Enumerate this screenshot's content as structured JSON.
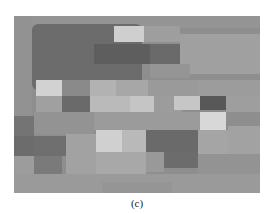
{
  "figure": {
    "caption": "(c)",
    "background": "#8f8f8f",
    "blocks": [
      {
        "x": 0,
        "y": 0,
        "w": 246,
        "h": 177,
        "c": "#8e8e8e"
      },
      {
        "x": 0,
        "y": 0,
        "w": 246,
        "h": 12,
        "c": "#949494"
      },
      {
        "x": 18,
        "y": 8,
        "w": 110,
        "h": 66,
        "c": "#6c6c6c",
        "r": 6
      },
      {
        "x": 100,
        "y": 10,
        "w": 30,
        "h": 16,
        "c": "#cfcfcf"
      },
      {
        "x": 130,
        "y": 10,
        "w": 36,
        "h": 16,
        "c": "#9e9e9e"
      },
      {
        "x": 80,
        "y": 28,
        "w": 56,
        "h": 20,
        "c": "#5e5e5e"
      },
      {
        "x": 136,
        "y": 28,
        "w": 30,
        "h": 20,
        "c": "#6a6a6a"
      },
      {
        "x": 166,
        "y": 18,
        "w": 80,
        "h": 40,
        "c": "#a0a0a0"
      },
      {
        "x": 0,
        "y": 0,
        "w": 18,
        "h": 100,
        "c": "#929292"
      },
      {
        "x": 136,
        "y": 48,
        "w": 40,
        "h": 14,
        "c": "#959595"
      },
      {
        "x": 22,
        "y": 64,
        "w": 26,
        "h": 16,
        "c": "#d2d2d2"
      },
      {
        "x": 48,
        "y": 64,
        "w": 28,
        "h": 16,
        "c": "#8a8a8a"
      },
      {
        "x": 76,
        "y": 64,
        "w": 26,
        "h": 16,
        "c": "#b2b2b2"
      },
      {
        "x": 102,
        "y": 64,
        "w": 32,
        "h": 16,
        "c": "#a7a7a7"
      },
      {
        "x": 134,
        "y": 64,
        "w": 50,
        "h": 16,
        "c": "#9a9a9a"
      },
      {
        "x": 184,
        "y": 64,
        "w": 62,
        "h": 16,
        "c": "#9c9c9c"
      },
      {
        "x": 22,
        "y": 80,
        "w": 26,
        "h": 16,
        "c": "#a0a0a0"
      },
      {
        "x": 48,
        "y": 80,
        "w": 28,
        "h": 16,
        "c": "#6a6a6a"
      },
      {
        "x": 76,
        "y": 80,
        "w": 40,
        "h": 16,
        "c": "#bababa"
      },
      {
        "x": 116,
        "y": 80,
        "w": 24,
        "h": 16,
        "c": "#c5c5c5"
      },
      {
        "x": 140,
        "y": 80,
        "w": 28,
        "h": 16,
        "c": "#9c9c9c"
      },
      {
        "x": 160,
        "y": 80,
        "w": 26,
        "h": 14,
        "c": "#c6c6c6"
      },
      {
        "x": 186,
        "y": 80,
        "w": 26,
        "h": 14,
        "c": "#585858"
      },
      {
        "x": 212,
        "y": 80,
        "w": 34,
        "h": 16,
        "c": "#9e9e9e"
      },
      {
        "x": 186,
        "y": 96,
        "w": 26,
        "h": 18,
        "c": "#d8d8d8"
      },
      {
        "x": 0,
        "y": 100,
        "w": 20,
        "h": 20,
        "c": "#747474"
      },
      {
        "x": 20,
        "y": 96,
        "w": 60,
        "h": 22,
        "c": "#939393"
      },
      {
        "x": 80,
        "y": 96,
        "w": 106,
        "h": 18,
        "c": "#9b9b9b"
      },
      {
        "x": 0,
        "y": 120,
        "w": 20,
        "h": 20,
        "c": "#6c6c6c"
      },
      {
        "x": 20,
        "y": 120,
        "w": 32,
        "h": 20,
        "c": "#6f6f6f"
      },
      {
        "x": 52,
        "y": 118,
        "w": 30,
        "h": 40,
        "c": "#a2a2a2"
      },
      {
        "x": 82,
        "y": 114,
        "w": 26,
        "h": 22,
        "c": "#d0d0d0"
      },
      {
        "x": 108,
        "y": 114,
        "w": 24,
        "h": 22,
        "c": "#b9b9b9"
      },
      {
        "x": 132,
        "y": 114,
        "w": 52,
        "h": 22,
        "c": "#6a6a6a"
      },
      {
        "x": 150,
        "y": 136,
        "w": 34,
        "h": 16,
        "c": "#6c6c6c"
      },
      {
        "x": 184,
        "y": 114,
        "w": 30,
        "h": 24,
        "c": "#a5a5a5"
      },
      {
        "x": 214,
        "y": 110,
        "w": 32,
        "h": 30,
        "c": "#a2a2a2"
      },
      {
        "x": 0,
        "y": 140,
        "w": 20,
        "h": 20,
        "c": "#9c9c9c"
      },
      {
        "x": 20,
        "y": 140,
        "w": 28,
        "h": 20,
        "c": "#7a7a7a"
      },
      {
        "x": 82,
        "y": 136,
        "w": 50,
        "h": 22,
        "c": "#a8a8a8"
      },
      {
        "x": 132,
        "y": 136,
        "w": 18,
        "h": 20,
        "c": "#999999"
      },
      {
        "x": 184,
        "y": 138,
        "w": 62,
        "h": 22,
        "c": "#939393"
      },
      {
        "x": 0,
        "y": 158,
        "w": 246,
        "h": 19,
        "c": "#9a9a9a"
      },
      {
        "x": 88,
        "y": 166,
        "w": 70,
        "h": 11,
        "c": "#959595"
      }
    ]
  }
}
